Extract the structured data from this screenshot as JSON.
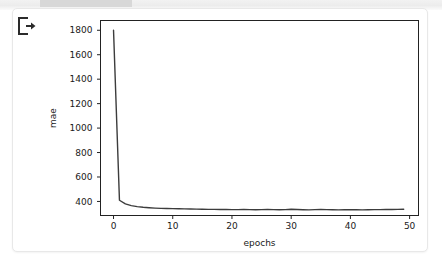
{
  "cell": {
    "icon_name": "output-export-icon"
  },
  "chart_data": {
    "type": "line",
    "title": "",
    "xlabel": "epochs",
    "ylabel": "mae",
    "xlim": [
      -2.2,
      51.5
    ],
    "ylim": [
      285,
      1880
    ],
    "grid": false,
    "legend": "none",
    "line_color": "#3c3c3c",
    "xticks": [
      0,
      10,
      20,
      30,
      40,
      50
    ],
    "xticklabels": [
      "0",
      "10",
      "20",
      "30",
      "40",
      "50"
    ],
    "yticks": [
      400,
      600,
      800,
      1000,
      1200,
      1400,
      1600,
      1800
    ],
    "yticklabels": [
      "400",
      "600",
      "800",
      "1000",
      "1200",
      "1400",
      "1600",
      "1800"
    ],
    "series": [
      {
        "name": "mae",
        "x": [
          0,
          1,
          2,
          3,
          4,
          5,
          6,
          7,
          8,
          9,
          10,
          11,
          12,
          13,
          14,
          15,
          16,
          17,
          18,
          19,
          20,
          21,
          22,
          23,
          24,
          25,
          26,
          27,
          28,
          29,
          30,
          31,
          32,
          33,
          34,
          35,
          36,
          37,
          38,
          39,
          40,
          41,
          42,
          43,
          44,
          45,
          46,
          47,
          48,
          49
        ],
        "values": [
          1800,
          410,
          380,
          366,
          358,
          352,
          348,
          345,
          343,
          342,
          341,
          340,
          339,
          338,
          337,
          336,
          335,
          335,
          334,
          334,
          333,
          333,
          334,
          333,
          332,
          333,
          334,
          333,
          332,
          333,
          336,
          334,
          332,
          331,
          333,
          335,
          333,
          332,
          331,
          332,
          333,
          332,
          331,
          332,
          333,
          333,
          334,
          334,
          335,
          336
        ]
      }
    ]
  }
}
